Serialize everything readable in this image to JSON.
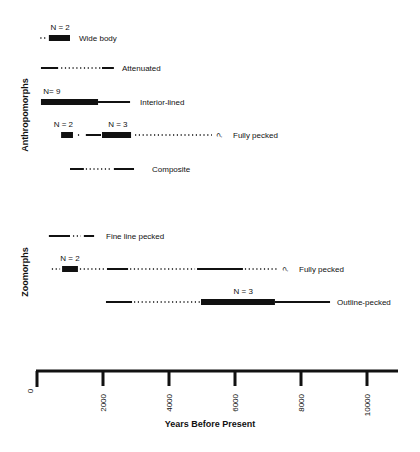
{
  "chart_data": {
    "type": "timeline",
    "xlabel": "Years Before Present",
    "xlim": [
      0,
      11000
    ],
    "xticks": [
      0,
      2000,
      4000,
      6000,
      8000,
      10000
    ],
    "colors": {
      "ink": "#111111"
    },
    "groups": [
      {
        "name": "Anthropomorphs",
        "rows": [
          {
            "label": "Wide body",
            "n_label": "N = 2",
            "n_at": 700,
            "segments": [
              {
                "style": "dotted",
                "from": 100,
                "to": 330
              },
              {
                "style": "thick",
                "from": 360,
                "to": 1000
              }
            ]
          },
          {
            "label": "Attenuated",
            "n_label": "",
            "segments": [
              {
                "style": "solid",
                "from": 120,
                "to": 640
              },
              {
                "style": "dotted",
                "from": 730,
                "to": 1940
              },
              {
                "style": "solid",
                "from": 1970,
                "to": 2330
              }
            ]
          },
          {
            "label": "Interior-lined",
            "n_label": "N= 9",
            "n_at": 450,
            "segments": [
              {
                "style": "thick",
                "from": 120,
                "to": 1850
              },
              {
                "style": "solid",
                "from": 1850,
                "to": 2820
              }
            ]
          },
          {
            "label": "Fully pecked",
            "n_label": "N = 2",
            "n_at": 800,
            "n_label2": "N = 3",
            "n_at2": 2450,
            "uncertain": true,
            "segments": [
              {
                "style": "thick",
                "from": 730,
                "to": 1090
              },
              {
                "style": "dotted",
                "from": 1240,
                "to": 1300
              },
              {
                "style": "solid",
                "from": 1480,
                "to": 1940
              },
              {
                "style": "thick",
                "from": 1970,
                "to": 2850
              },
              {
                "style": "dotted",
                "from": 2970,
                "to": 5300
              }
            ]
          },
          {
            "label": "Composite",
            "n_label": "",
            "segments": [
              {
                "style": "solid",
                "from": 1000,
                "to": 1420
              },
              {
                "style": "dotted",
                "from": 1480,
                "to": 2210
              },
              {
                "style": "solid",
                "from": 2330,
                "to": 2940
              }
            ]
          }
        ]
      },
      {
        "name": "Zoomorphs",
        "rows": [
          {
            "label": "Fine line pecked",
            "n_label": "",
            "segments": [
              {
                "style": "solid",
                "from": 360,
                "to": 1000
              },
              {
                "style": "dotted",
                "from": 1090,
                "to": 1330
              },
              {
                "style": "solid",
                "from": 1420,
                "to": 1730
              }
            ]
          },
          {
            "label": "Fully pecked",
            "n_label": "N = 2",
            "n_at": 1000,
            "uncertain": true,
            "segments": [
              {
                "style": "dotted",
                "from": 450,
                "to": 700
              },
              {
                "style": "thick",
                "from": 760,
                "to": 1240
              },
              {
                "style": "dotted",
                "from": 1300,
                "to": 2060
              },
              {
                "style": "solid",
                "from": 2120,
                "to": 2760
              },
              {
                "style": "dotted",
                "from": 2820,
                "to": 4790
              },
              {
                "style": "solid",
                "from": 4850,
                "to": 6240
              },
              {
                "style": "dotted",
                "from": 6300,
                "to": 7300
              }
            ]
          },
          {
            "label": "Outline-pecked",
            "n_label": "N = 3",
            "n_at": 6250,
            "segments": [
              {
                "style": "solid",
                "from": 2090,
                "to": 2880
              },
              {
                "style": "dotted",
                "from": 2940,
                "to": 4940
              },
              {
                "style": "thick",
                "from": 4970,
                "to": 7210
              },
              {
                "style": "solid",
                "from": 7210,
                "to": 8880
              }
            ]
          }
        ]
      }
    ]
  }
}
